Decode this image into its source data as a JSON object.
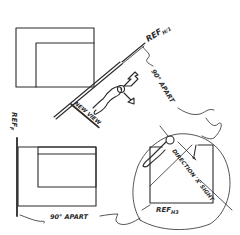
{
  "diagram": {
    "labels": {
      "ref_top": "REF",
      "ref_top_sub": "H/1",
      "ref_left": "REF",
      "ref_left_sub": "F",
      "ref_bottom": "REF",
      "ref_bottom_sub": "H3",
      "apart_top": "90° APART",
      "apart_bottom": "90° APART",
      "new_view": "NEW VIEW",
      "direction_sight": "DIRECTION 'X' SIGHT"
    },
    "colors": {
      "ink": "#2a2a2a",
      "background": "#ffffff"
    }
  }
}
